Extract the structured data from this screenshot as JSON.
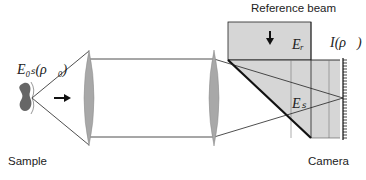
{
  "diagram": {
    "labels": {
      "reference_beam": "Reference beam",
      "sample": "Sample",
      "camera": "Camera",
      "object_field": "E0s(ρ0)",
      "object_field_display": "E₀ₛ(ρ⃗₀)",
      "reference_field": "Er",
      "reference_field_display": "Eᵣ",
      "signal_field": "Es",
      "signal_field_display": "Eₛ",
      "intensity": "I(ρ)",
      "intensity_display": "I(ρ⃗)"
    },
    "colors": {
      "background": "#ffffff",
      "lens_fill": "#a8a8a8",
      "beam_fill": "#d6d6d6",
      "line": "#222222",
      "sample_fill": "#666666"
    },
    "components": [
      "sample",
      "lens-1",
      "lens-2",
      "beam-splitter",
      "reference-beam",
      "camera"
    ]
  }
}
